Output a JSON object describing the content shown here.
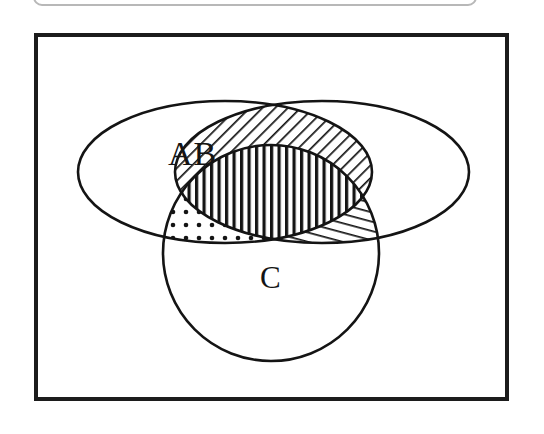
{
  "figure": {
    "kind": "venn-diagram",
    "set_count": 3,
    "background_color": "#ffffff",
    "stroke_color": "#141414",
    "frame": {
      "name": "figure-border",
      "border_color": "#1c1c1c",
      "border_width_px": 4
    },
    "top_strip": {
      "name": "cut-off-rounded-box",
      "border_color": "#b8b8b8"
    }
  },
  "labels": {
    "ab": "AB",
    "c": "C"
  },
  "chart_data": {
    "type": "venn",
    "title": "",
    "sets": [
      {
        "id": "A",
        "shape": "ellipse",
        "label": "",
        "cx": 225,
        "cy": 172,
        "rx": 147,
        "ry": 71,
        "fill": "none",
        "stroke": "#141414"
      },
      {
        "id": "B",
        "shape": "ellipse",
        "label": "",
        "cx": 322,
        "cy": 172,
        "rx": 147,
        "ry": 71,
        "fill": "none",
        "stroke": "#141414"
      },
      {
        "id": "C",
        "shape": "circle",
        "label": "C",
        "cx": 271,
        "cy": 253,
        "r": 108,
        "fill": "none",
        "stroke": "#141414"
      }
    ],
    "regions": [
      {
        "id": "A-only",
        "sets": [
          "A"
        ],
        "fill_pattern": "none",
        "label": "AB",
        "label_x": 196,
        "label_y": 156
      },
      {
        "id": "B-only",
        "sets": [
          "B"
        ],
        "fill_pattern": "none",
        "label": ""
      },
      {
        "id": "C-only",
        "sets": [
          "C"
        ],
        "fill_pattern": "none",
        "label": "C",
        "label_x": 271,
        "label_y": 278
      },
      {
        "id": "A-and-B",
        "sets": [
          "A",
          "B"
        ],
        "fill_pattern": "diagonal-hatch-45",
        "pattern_angle_deg": 45,
        "label": ""
      },
      {
        "id": "A-and-C",
        "sets": [
          "A",
          "C"
        ],
        "fill_pattern": "dots",
        "label": ""
      },
      {
        "id": "B-and-C",
        "sets": [
          "B",
          "C"
        ],
        "fill_pattern": "shallow-diagonal-hatch",
        "pattern_angle_deg": 15,
        "label": ""
      },
      {
        "id": "A-and-B-and-C",
        "sets": [
          "A",
          "B",
          "C"
        ],
        "fill_pattern": "vertical-stripes",
        "pattern_angle_deg": 90,
        "label": ""
      }
    ],
    "legend_position": "none",
    "grid": false
  }
}
